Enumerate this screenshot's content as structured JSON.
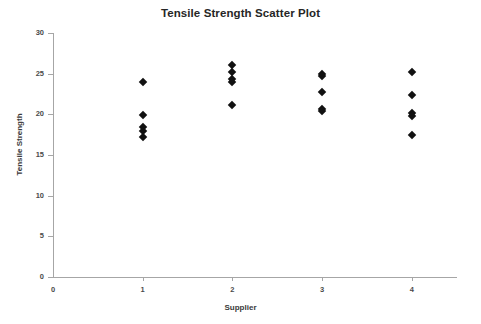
{
  "chart_data": {
    "type": "scatter",
    "title": "Tensile Strength Scatter Plot",
    "xlabel": "Supplier",
    "ylabel": "Tensile Strength",
    "xlim": [
      0,
      4.5
    ],
    "ylim": [
      0,
      30
    ],
    "x_ticks": [
      0,
      1,
      2,
      3,
      4
    ],
    "x_tick_labels": [
      "0",
      "1",
      "2",
      "3",
      "4"
    ],
    "y_ticks": [
      0,
      5,
      10,
      15,
      20,
      25,
      30
    ],
    "y_tick_labels": [
      "0",
      "5",
      "10",
      "15",
      "20",
      "25",
      "30"
    ],
    "grid": false,
    "legend": null,
    "marker": "diamond",
    "marker_color": "#111111",
    "axis_color": "#a6a6a6",
    "points": [
      {
        "x": 1,
        "y": 24.0
      },
      {
        "x": 1,
        "y": 19.9
      },
      {
        "x": 1,
        "y": 18.4
      },
      {
        "x": 1,
        "y": 18.0
      },
      {
        "x": 1,
        "y": 17.2
      },
      {
        "x": 2,
        "y": 26.1
      },
      {
        "x": 2,
        "y": 25.2
      },
      {
        "x": 2,
        "y": 24.4
      },
      {
        "x": 2,
        "y": 24.0
      },
      {
        "x": 2,
        "y": 21.2
      },
      {
        "x": 3,
        "y": 25.0
      },
      {
        "x": 3,
        "y": 24.7
      },
      {
        "x": 3,
        "y": 22.7
      },
      {
        "x": 3,
        "y": 20.6
      },
      {
        "x": 3,
        "y": 20.4
      },
      {
        "x": 4,
        "y": 25.2
      },
      {
        "x": 4,
        "y": 22.4
      },
      {
        "x": 4,
        "y": 20.2
      },
      {
        "x": 4,
        "y": 19.8
      },
      {
        "x": 4,
        "y": 17.4
      }
    ],
    "series_by_supplier": [
      {
        "name": "Supplier 1",
        "values": [
          24.0,
          19.9,
          18.4,
          18.0,
          17.2
        ]
      },
      {
        "name": "Supplier 2",
        "values": [
          26.1,
          25.2,
          24.4,
          24.0,
          21.2
        ]
      },
      {
        "name": "Supplier 3",
        "values": [
          25.0,
          24.7,
          22.7,
          20.6,
          20.4
        ]
      },
      {
        "name": "Supplier 4",
        "values": [
          25.2,
          22.4,
          20.2,
          19.8,
          17.4
        ]
      }
    ]
  }
}
